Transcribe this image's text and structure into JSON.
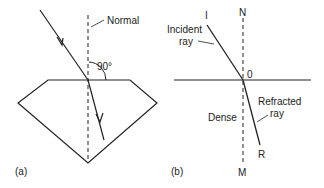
{
  "panel_a": {
    "caption": "(a)",
    "normal_label": "Normal",
    "angle_label": "90°"
  },
  "panel_b": {
    "caption": "(b)",
    "point_I": "I",
    "point_N": "N",
    "point_O": "0",
    "point_R": "R",
    "point_M": "M",
    "incident_label_1": "Incident",
    "incident_label_2": "ray",
    "medium_label": "Dense",
    "refracted_label_1": "Refracted",
    "refracted_label_2": "ray"
  },
  "colors": {
    "line": "#222222",
    "background": "#ffffff"
  }
}
